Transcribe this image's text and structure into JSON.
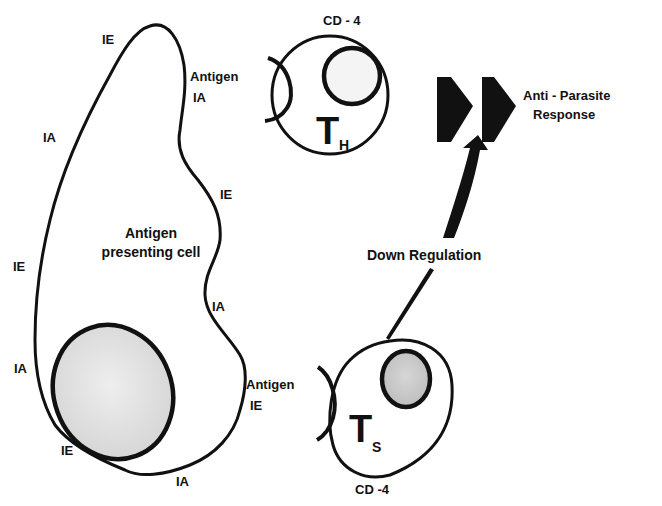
{
  "diagram": {
    "apc": {
      "title_line1": "Antigen",
      "title_line2": "presenting cell",
      "surface_labels": [
        "IE",
        "IA",
        "IE",
        "IA",
        "IE",
        "IA",
        "IE",
        "IA"
      ],
      "antigen_ia": {
        "line1": "Antigen",
        "line2": "IA"
      },
      "antigen_ie": {
        "line1": "Antigen",
        "line2": "IE"
      }
    },
    "helper_cell": {
      "marker": "CD - 4",
      "letter": "T",
      "subscript": "H"
    },
    "suppressor_cell": {
      "marker": "CD -4",
      "letter": "T",
      "subscript": "S"
    },
    "response": {
      "line1": "Anti - Parasite",
      "line2": "Response"
    },
    "down_regulation": "Down Regulation",
    "colors": {
      "ink": "#111111",
      "nucleus_fill": "#d9d9d9",
      "nucleus_fill_dark": "#c4c4c4",
      "background": "#ffffff"
    }
  }
}
